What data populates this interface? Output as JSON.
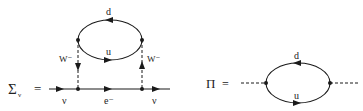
{
  "diagram_left": {
    "lhs_symbol": "Σ",
    "lhs_subscript": "ν",
    "equals": "=",
    "incoming_label": "ν",
    "propagator_label": "e⁻",
    "outgoing_label": "ν",
    "left_boson_label": "W⁻",
    "right_boson_label": "W⁻",
    "loop_top_label": "d",
    "loop_bottom_label": "u"
  },
  "diagram_right": {
    "lhs_symbol": "Π",
    "equals": "=",
    "loop_top_label": "d",
    "loop_bottom_label": "u"
  },
  "colors": {
    "line": "#1a1a1a",
    "background": "#ffffff"
  }
}
